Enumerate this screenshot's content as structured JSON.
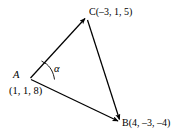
{
  "figure": {
    "type": "vector-triangle-diagram",
    "background_color": "#ffffff",
    "stroke_color": "#000000",
    "width": 184,
    "height": 137,
    "vertices": {
      "A": {
        "name_label": "A",
        "coords_label": "(1, 1, 8)",
        "coordinates": [
          1,
          1,
          8
        ],
        "pixel": [
          30,
          78
        ]
      },
      "C": {
        "name_label": "C(–3, 1, 5)",
        "coordinates": [
          -3,
          1,
          5
        ],
        "pixel": [
          86,
          17
        ]
      },
      "B": {
        "name_label": "B(4, –3, –4)",
        "coordinates": [
          4,
          -3,
          -4
        ],
        "pixel": [
          120,
          122
        ]
      }
    },
    "angle": {
      "symbol": "α",
      "at_vertex": "A",
      "between": [
        "AC",
        "AB"
      ]
    },
    "arrows": [
      {
        "name": "vector-AC",
        "from": "A",
        "to": "C"
      },
      {
        "name": "vector-AB",
        "from": "A",
        "to": "B"
      },
      {
        "name": "vector-CB",
        "from": "C",
        "to": "B"
      }
    ]
  }
}
